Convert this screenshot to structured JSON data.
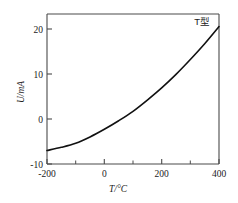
{
  "chart_data": {
    "type": "line",
    "title": "",
    "subtitle": "",
    "xlabel": "T/°C",
    "ylabel": "U/mA",
    "xlim": [
      -200,
      400
    ],
    "ylim": [
      -10,
      23.3
    ],
    "grid": false,
    "legend_position": "top-right-inside",
    "annotations": [
      {
        "text": "T型",
        "x": 360,
        "y": 22
      }
    ],
    "x_major_ticks": [
      -200,
      0,
      200,
      400
    ],
    "x_major_tick_labels": [
      "-200",
      "0",
      "200",
      "400"
    ],
    "x_minor_ticks": [
      -100,
      100,
      300
    ],
    "y_major_ticks": [
      -10,
      0,
      10,
      20
    ],
    "y_major_tick_labels": [
      "-10",
      "0",
      "10",
      "20"
    ],
    "y_minor_ticks": [],
    "series": [
      {
        "name": "T型",
        "color": "#111111",
        "x": [
          -200,
          -150,
          -100,
          -50,
          0,
          50,
          100,
          150,
          200,
          250,
          300,
          350,
          400
        ],
        "values": [
          -7.0,
          -6.3,
          -5.4,
          -4.0,
          -2.3,
          -0.4,
          1.7,
          4.2,
          6.9,
          9.9,
          13.2,
          16.7,
          20.5
        ]
      }
    ]
  },
  "axis_labels": {
    "x_title": "T/°C",
    "y_title": "U/mA"
  },
  "annotation": {
    "series_label": "T型"
  }
}
